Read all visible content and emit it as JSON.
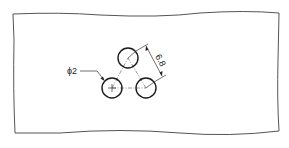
{
  "drawing": {
    "diameter_label": "ϕ2",
    "spacing_label": "6.8",
    "colors": {
      "line": "#1a1a1a",
      "frame": "#555555",
      "background": "#ffffff"
    },
    "circles": [
      {
        "name": "top-hole",
        "cx": 128,
        "cy": 58,
        "r": 10
      },
      {
        "name": "bottom-left-hole",
        "cx": 112,
        "cy": 88,
        "r": 10
      },
      {
        "name": "bottom-right-hole",
        "cx": 146,
        "cy": 88,
        "r": 10
      }
    ]
  }
}
